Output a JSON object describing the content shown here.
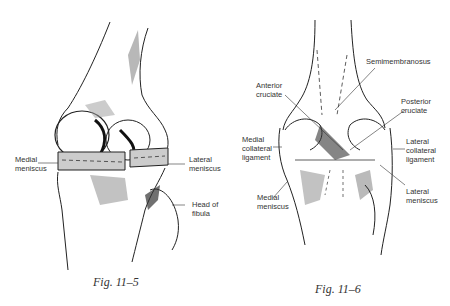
{
  "figures": [
    {
      "caption": "Fig. 11–5",
      "labels": {
        "medial_meniscus": "Medial\nmeniscus",
        "lateral_meniscus": "Lateral\nmeniscus",
        "head_of_fibula": "Head of\nfibula"
      }
    },
    {
      "caption": "Fig. 11–6",
      "labels": {
        "semimembranosus": "Semimembranosus",
        "anterior_cruciate": "Anterior\ncruciate",
        "posterior_cruciate": "Posterior\ncruciate",
        "medial_collateral_ligament": "Medial\ncollateral\nligament",
        "lateral_collateral_ligament": "Lateral\ncollateral\nligament",
        "medial_meniscus": "Medial\nmeniscus",
        "lateral_meniscus": "Lateral\nmeniscus"
      }
    }
  ]
}
